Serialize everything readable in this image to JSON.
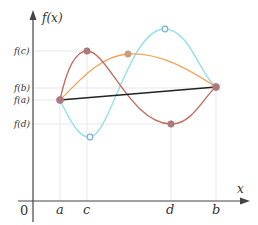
{
  "diagram": {
    "y_axis_label": "f(x)",
    "x_axis_label": "x",
    "origin_label": "0",
    "y_labels": {
      "fc": "f(c)",
      "fb": "f(b)",
      "fa": "f(a)",
      "fd": "f(d)"
    },
    "x_labels": {
      "a": "a",
      "c": "c",
      "d": "d",
      "b": "b"
    },
    "colors": {
      "axis": "#444444",
      "secant": "#222222",
      "red_curve": "#c2705e",
      "orange_curve": "#f0a45a",
      "cyan_curve": "#8fe0ea",
      "point_fill": "#a27d88",
      "cyan_point": "#7aaee6",
      "guide": "#e6e8ee"
    },
    "curves": [
      {
        "name": "red",
        "description": "rises from f(a) to max f(c) at c, falls to min f(d) at d, rises to f(b) at b"
      },
      {
        "name": "orange",
        "description": "rises from f(a) to a max between c and d, falls to f(b)"
      },
      {
        "name": "cyan",
        "description": "falls from f(a) to a min near c, rises to a max near d, falls to f(b)"
      },
      {
        "name": "secant",
        "description": "straight line from (a, f(a)) to (b, f(b))"
      }
    ]
  }
}
